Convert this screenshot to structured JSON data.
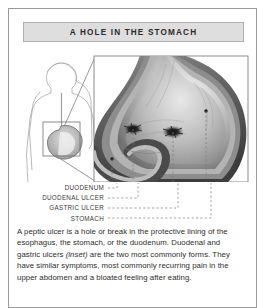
{
  "figure": {
    "title": "A HOLE IN THE STOMACH",
    "illustration": {
      "name": "stomach-cross-section-with-ulcers",
      "inset_name": "human-torso-inset",
      "description": "Grayscale cross-section of a stomach and duodenum shown in an enlarged callout box, with an inset outline of a human torso indicating the stomach location. Two dark ulcer craters are marked inside.",
      "markers": [
        {
          "name": "duodenal-ulcer-marker"
        },
        {
          "name": "gastric-ulcer-marker"
        },
        {
          "name": "stomach-marker"
        },
        {
          "name": "duodenum-marker"
        }
      ]
    },
    "labels": [
      "DUODENUM",
      "DUODENAL ULCER",
      "GASTRIC ULCER",
      "STOMACH"
    ],
    "caption": {
      "part1": "A peptic ulcer is a hole or break in the protective lining of the esophagus, the stomach, or the duodenum. Duodenal and gastric ulcers ",
      "emphasis": "(inset)",
      "part2": " are the two most commonly forms. They have similar symptoms, most commonly recurring pain in the upper abdomen and a bloated feeling after eating."
    },
    "colors": {
      "frame_border": "#9a9a9a",
      "title_background": "#dedede",
      "title_border": "#b0b0b0",
      "title_text": "#2b2b2b",
      "label_text": "#3a3a3a",
      "body_text": "#2e2e2e",
      "leader_line": "#8c8c8c",
      "organ_outline": "#555555",
      "page_background": "#ffffff"
    }
  }
}
